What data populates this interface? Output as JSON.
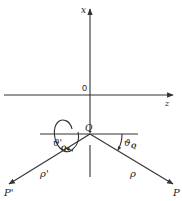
{
  "diagram": {
    "axes": {
      "vertical_label": "x",
      "horizontal_label": "z",
      "origin_label": "0"
    },
    "points": {
      "Q": "Q",
      "P": "P",
      "P_prime": "P'"
    },
    "distances": {
      "rho": "ρ",
      "rho_prime": "ρ'"
    },
    "angles": {
      "theta_Q": "ϑ",
      "theta_Q_sub": "Q",
      "theta_Q_prime": "ϑ'",
      "theta_Q_prime_sub": "Q"
    },
    "colors": {
      "line": "#333333",
      "background": "#ffffff"
    }
  }
}
